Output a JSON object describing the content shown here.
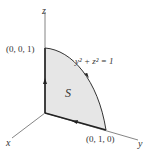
{
  "diagram": {
    "axes": {
      "x_label": "x",
      "y_label": "y",
      "z_label": "z"
    },
    "points": {
      "top": "(0, 0, 1)",
      "right": "(0, 1, 0)"
    },
    "curve_equation": "y² + z² = 1",
    "surface_label": "S",
    "colors": {
      "fill": "#e6e6e6",
      "axis": "#555555",
      "edge": "#222222"
    }
  }
}
